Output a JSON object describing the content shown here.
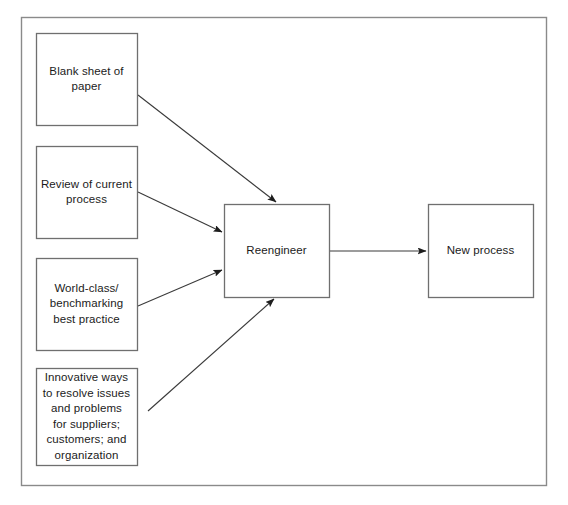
{
  "diagram": {
    "frame": {
      "name": "diagram-frame",
      "x": 21,
      "y": 17,
      "width": 525,
      "height": 468,
      "stroke": "#8a8a8a",
      "stroke_width": 1.4,
      "fill": "#ffffff"
    },
    "style": {
      "box_stroke": "#6f6f6f",
      "box_fill": "#ffffff",
      "box_stroke_width": 1.3,
      "connector_stroke": "#3a3a3a",
      "connector_stroke_width": 1.1,
      "text_color": "#1b1b1b"
    },
    "nodes": [
      {
        "id": "blank-sheet-of-paper",
        "name": "node-blank-sheet-of-paper",
        "label": "Blank sheet of\npaper",
        "x": 36,
        "y": 33,
        "width": 101,
        "height": 92
      },
      {
        "id": "review-of-current-process",
        "name": "node-review-of-current-process",
        "label": "Review of current\nprocess",
        "x": 36,
        "y": 146,
        "width": 101,
        "height": 92
      },
      {
        "id": "world-class-benchmarking",
        "name": "node-world-class-benchmarking",
        "label": "World-class/\nbenchmarking\nbest practice",
        "x": 36,
        "y": 258,
        "width": 101,
        "height": 92
      },
      {
        "id": "innovative-ways",
        "name": "node-innovative-ways",
        "label": "Innovative ways\nto resolve issues\nand problems\nfor suppliers;\ncustomers; and\norganization",
        "x": 36,
        "y": 368,
        "width": 101,
        "height": 97
      },
      {
        "id": "reengineer",
        "name": "node-reengineer",
        "label": "Reengineer",
        "x": 224,
        "y": 204,
        "width": 105,
        "height": 93
      },
      {
        "id": "new-process",
        "name": "node-new-process",
        "label": "New process",
        "x": 428,
        "y": 204,
        "width": 105,
        "height": 93
      }
    ],
    "connectors": [
      {
        "id": "blank-sheet-to-reengineer",
        "name": "connector-blank-sheet-to-reengineer",
        "from": "blank-sheet-of-paper",
        "to": "reengineer",
        "x1": 138,
        "y1": 95,
        "x2": 276,
        "y2": 202
      },
      {
        "id": "review-to-reengineer",
        "name": "connector-review-to-reengineer",
        "from": "review-of-current-process",
        "to": "reengineer",
        "x1": 138,
        "y1": 192,
        "x2": 222,
        "y2": 232
      },
      {
        "id": "world-class-to-reengineer",
        "name": "connector-world-class-to-reengineer",
        "from": "world-class-benchmarking",
        "to": "reengineer",
        "x1": 138,
        "y1": 306,
        "x2": 222,
        "y2": 270
      },
      {
        "id": "innovative-to-reengineer",
        "name": "connector-innovative-to-reengineer",
        "from": "innovative-ways",
        "to": "reengineer",
        "x1": 148,
        "y1": 411,
        "x2": 274,
        "y2": 299
      },
      {
        "id": "reengineer-to-new-process",
        "name": "connector-reengineer-to-new-process",
        "from": "reengineer",
        "to": "new-process",
        "x1": 329,
        "y1": 251,
        "x2": 426,
        "y2": 251
      }
    ]
  }
}
